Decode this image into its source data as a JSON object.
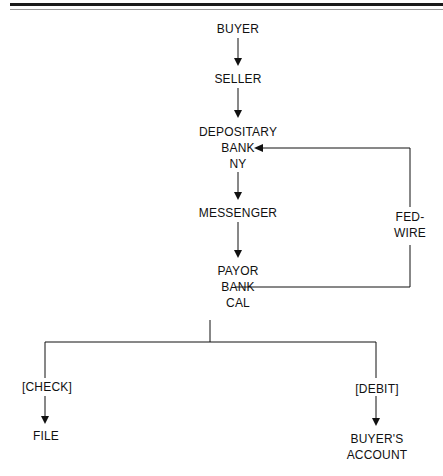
{
  "diagram": {
    "type": "flowchart",
    "nodes": {
      "buyer": "BUYER",
      "seller": "SELLER",
      "depositary": [
        "DEPOSITARY",
        "BANK",
        "NY"
      ],
      "messenger": "MESSENGER",
      "payor": [
        "PAYOR",
        "BANK",
        "CAL"
      ],
      "fedwire": [
        "FED-",
        "WIRE"
      ],
      "check": "[CHECK]",
      "file": "FILE",
      "debit": "[DEBIT]",
      "buyers_account": [
        "BUYER'S",
        "ACCOUNT"
      ]
    },
    "edges": [
      {
        "from": "BUYER",
        "to": "SELLER"
      },
      {
        "from": "SELLER",
        "to": "DEPOSITARY BANK NY"
      },
      {
        "from": "DEPOSITARY BANK NY",
        "to": "MESSENGER"
      },
      {
        "from": "MESSENGER",
        "to": "PAYOR BANK CAL"
      },
      {
        "from": "PAYOR BANK CAL",
        "to": "DEPOSITARY BANK NY",
        "via": "FED-WIRE"
      },
      {
        "from": "PAYOR BANK CAL",
        "to": "FILE",
        "label": "[CHECK]"
      },
      {
        "from": "PAYOR BANK CAL",
        "to": "BUYER'S ACCOUNT",
        "label": "[DEBIT]"
      }
    ]
  }
}
